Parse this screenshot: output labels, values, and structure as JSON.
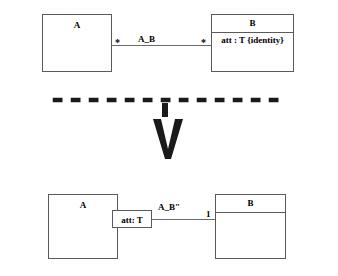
{
  "diagram": {
    "type": "uml-class-transformation",
    "background": "#ffffff",
    "line_color": "#5a5a5a",
    "separator_color": "#1a1a1a",
    "arrow_color": "#1a1a1a"
  },
  "top": {
    "class_a": {
      "name": "A",
      "has_divider": false,
      "attributes": []
    },
    "class_b": {
      "name": "B",
      "has_divider": true,
      "attribute": "att : T {identity}"
    },
    "association": {
      "label": "A_B",
      "source_multiplicity": "*",
      "target_multiplicity": "*"
    }
  },
  "separator": {
    "style": "dashed"
  },
  "arrow": {
    "direction": "down",
    "shape": "chevron"
  },
  "bottom": {
    "class_a": {
      "name": "A",
      "has_divider": false
    },
    "class_b": {
      "name": "B",
      "has_divider": true,
      "attribute": ""
    },
    "attribute_box": {
      "label": "att: T"
    },
    "association": {
      "label": "A_B\"",
      "target_multiplicity": "1"
    }
  }
}
